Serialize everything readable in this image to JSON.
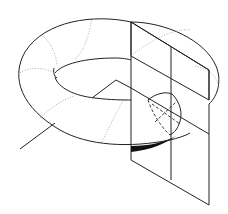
{
  "figure": {
    "colors": {
      "line": "#222222",
      "hidden_line": "#999999",
      "background": "#ffffff"
    },
    "elements": [
      "torus-outer-silhouette",
      "torus-inner-hole",
      "meridian-circles-dotted",
      "cutting-plane",
      "cross-section-circle",
      "pointer-line"
    ]
  }
}
